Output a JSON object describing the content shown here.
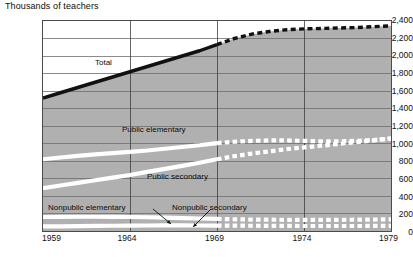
{
  "chart_data": {
    "type": "area",
    "title": "Thousands of teachers",
    "xlabel": "",
    "ylabel": "Thousands of teachers",
    "xlim": [
      1959,
      1979
    ],
    "ylim": [
      0,
      2400
    ],
    "ytick_step": 200,
    "grid": true,
    "legend": "inline-annotations",
    "projection_starts": 1969,
    "projection_style": "dashed",
    "y_ticks": [
      "0",
      "200",
      "400",
      "600",
      "800",
      "1,000",
      "1,200",
      "1,400",
      "1,600",
      "1,800",
      "2,000",
      "2,200",
      "2,400"
    ],
    "x_ticks": [
      "1959",
      "1964",
      "1969",
      "1974",
      "1979"
    ],
    "x": [
      1959,
      1960,
      1961,
      1962,
      1963,
      1964,
      1965,
      1966,
      1967,
      1968,
      1969,
      1970,
      1971,
      1972,
      1973,
      1974,
      1975,
      1976,
      1977,
      1978,
      1979
    ],
    "series": [
      {
        "name": "Total",
        "style": "thick-black-line",
        "values": [
          1520,
          1580,
          1640,
          1700,
          1760,
          1820,
          1880,
          1940,
          2000,
          2060,
          2130,
          2200,
          2250,
          2280,
          2300,
          2310,
          2315,
          2320,
          2325,
          2335,
          2345
        ]
      },
      {
        "name": "Public elementary",
        "style": "white-band",
        "values": [
          820,
          840,
          858,
          875,
          890,
          905,
          920,
          940,
          960,
          980,
          1005,
          1020,
          1030,
          1035,
          1035,
          1030,
          1025,
          1025,
          1030,
          1040,
          1055
        ]
      },
      {
        "name": "Public secondary",
        "style": "white-band",
        "values": [
          490,
          520,
          550,
          580,
          610,
          640,
          675,
          710,
          745,
          780,
          820,
          855,
          885,
          910,
          935,
          955,
          975,
          995,
          1015,
          1035,
          1060
        ]
      },
      {
        "name": "Nonpublic elementary",
        "style": "white-band",
        "values": [
          160,
          162,
          163,
          163,
          162,
          160,
          157,
          153,
          148,
          143,
          138,
          134,
          131,
          129,
          128,
          127,
          127,
          128,
          129,
          131,
          133
        ]
      },
      {
        "name": "Nonpublic secondary",
        "style": "white-band",
        "values": [
          52,
          54,
          56,
          58,
          60,
          62,
          63,
          64,
          64,
          63,
          62,
          61,
          60,
          59,
          58,
          57,
          57,
          57,
          57,
          58,
          58
        ]
      }
    ],
    "annotations": [
      {
        "text": "Total",
        "x": 95,
        "y": 58
      },
      {
        "text": "Public elementary",
        "x": 122,
        "y": 125
      },
      {
        "text": "Public secondary",
        "x": 147,
        "y": 172
      },
      {
        "text": "Nonpublic elementary",
        "x": 48,
        "y": 203
      },
      {
        "text": "Nonpublic secondary",
        "x": 172,
        "y": 203
      }
    ],
    "colors": {
      "plot_fill": "#b0b0b0",
      "band": "#ffffff",
      "total_line": "#111111",
      "grid": "#6e6e6e",
      "frame": "#4a4a4a",
      "text": "#111111"
    }
  }
}
